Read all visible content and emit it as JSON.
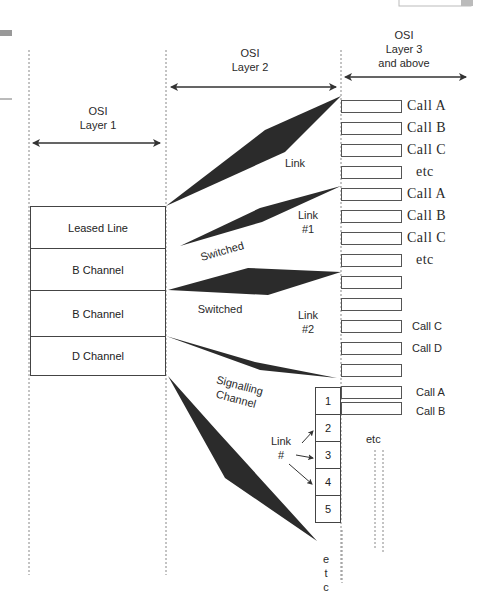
{
  "layers": {
    "layer1": {
      "line1": "OSI",
      "line2": "Layer 1"
    },
    "layer2": {
      "line1": "OSI",
      "line2": "Layer 2"
    },
    "layer3": {
      "line1": "OSI",
      "line2": "Layer 3",
      "line3": "and above"
    }
  },
  "channels": [
    {
      "label": "Leased Line"
    },
    {
      "label": "B Channel"
    },
    {
      "label": "B Channel"
    },
    {
      "label": "D Channel"
    }
  ],
  "link_labels": {
    "link": "Link",
    "link1_a": "Link",
    "link1_b": "#1",
    "link2_a": "Link",
    "link2_b": "#2",
    "switched_1": "Switched",
    "switched_2": "Switched",
    "signalling_a": "Signalling",
    "signalling_b": "Channel",
    "link_num_a": "Link",
    "link_num_b": "#"
  },
  "calls": {
    "group1": [
      "Call A",
      "Call B",
      "Call C",
      "etc"
    ],
    "group2": [
      "Call A",
      "Call B",
      "Call C",
      "etc"
    ],
    "group3": [
      "Call C",
      "Call D"
    ],
    "group4": [
      "Call A",
      "Call B"
    ],
    "etc_lower": "etc"
  },
  "link_numbers": [
    "1",
    "2",
    "3",
    "4",
    "5"
  ],
  "etc_vertical": [
    "e",
    "t",
    "c"
  ],
  "colors": {
    "wedge": "#2b2b2b",
    "line": "#444444",
    "dotted": "#888888"
  }
}
